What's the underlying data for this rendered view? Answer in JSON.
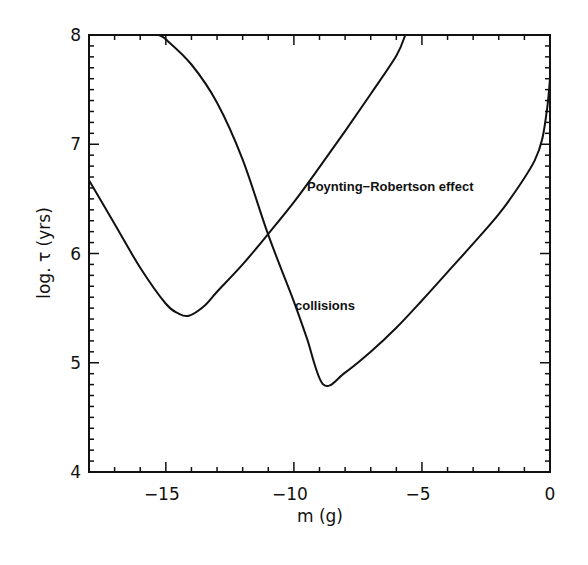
{
  "chart_data": {
    "type": "line",
    "title": "",
    "xlabel": "m (g)",
    "ylabel": "log. τ (yrs)",
    "xlim": [
      -18,
      0
    ],
    "ylim": [
      4,
      8
    ],
    "grid": false,
    "x_ticks": [
      {
        "value": -15,
        "label": "−15"
      },
      {
        "value": -10,
        "label": "−10"
      },
      {
        "value": -5,
        "label": "−5"
      },
      {
        "value": 0,
        "label": "0"
      }
    ],
    "y_ticks": [
      {
        "value": 4,
        "label": "4"
      },
      {
        "value": 5,
        "label": "5"
      },
      {
        "value": 6,
        "label": "6"
      },
      {
        "value": 7,
        "label": "7"
      },
      {
        "value": 8,
        "label": "8"
      }
    ],
    "series": [
      {
        "name": "Poynting-Robertson effect",
        "x": [
          -18.0,
          -17.0,
          -16.0,
          -15.0,
          -14.5,
          -14.1,
          -13.5,
          -13.0,
          -12.0,
          -11.0,
          -10.0,
          -9.0,
          -8.0,
          -7.0,
          -6.0,
          -5.65
        ],
        "y": [
          6.67,
          6.27,
          5.87,
          5.54,
          5.45,
          5.43,
          5.52,
          5.65,
          5.9,
          6.18,
          6.47,
          6.79,
          7.12,
          7.46,
          7.81,
          8.0
        ]
      },
      {
        "name": "collisions",
        "x": [
          -15.3,
          -15.0,
          -14.0,
          -13.0,
          -12.0,
          -11.0,
          -10.0,
          -9.5,
          -8.85,
          -8.0,
          -7.0,
          -6.0,
          -5.0,
          -4.0,
          -3.0,
          -2.0,
          -1.2,
          -0.6,
          -0.3,
          -0.1,
          0.0
        ],
        "y": [
          8.0,
          7.96,
          7.73,
          7.38,
          6.86,
          6.17,
          5.56,
          5.23,
          4.8,
          4.91,
          5.1,
          5.32,
          5.57,
          5.83,
          6.09,
          6.36,
          6.62,
          6.85,
          7.05,
          7.35,
          7.6
        ]
      }
    ],
    "annotations": [
      {
        "text": "Poynting−Robertson effect",
        "x": -9.1,
        "y": 6.62
      },
      {
        "text": "collisions",
        "x": -9.8,
        "y": 5.52
      }
    ]
  }
}
